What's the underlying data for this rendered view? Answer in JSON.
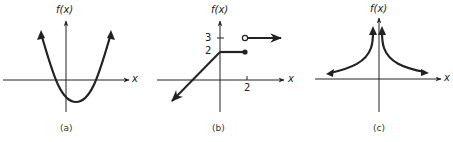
{
  "figures": [
    {
      "id": "a",
      "caption": "(a)",
      "y_axis_label": "f(x)",
      "x_axis_label": "x",
      "description": "Upward-opening parabola with vertex below the x-axis, slightly right of the y-axis; both ends continue upward (arrows)."
    },
    {
      "id": "b",
      "caption": "(b)",
      "y_axis_label": "f(x)",
      "x_axis_label": "x",
      "y_ticks": [
        "3",
        "2"
      ],
      "x_ticks": [
        "2"
      ],
      "description": "Piecewise function: line rising to (0,2) extending down-left (arrow); constant 2 from x=0 to x=2 with closed dot at (2,2); open circle at (2,3) with constant 3 continuing right (arrow)."
    },
    {
      "id": "c",
      "caption": "(c)",
      "y_axis_label": "f(x)",
      "x_axis_label": "x",
      "description": "Function symmetric about the y-axis with a vertical asymptote at x=0, rising toward infinity near 0 and approaching the x-axis as |x| grows (arrows on all ends)."
    }
  ]
}
